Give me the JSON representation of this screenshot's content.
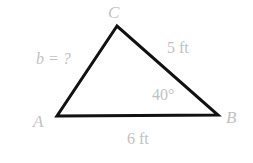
{
  "figure": {
    "type": "triangle-diagram",
    "background_color": "#ffffff",
    "stroke_color": "#111111",
    "label_color": "#c2c2c2",
    "width": 253,
    "height": 163
  },
  "vertices": {
    "A": {
      "label": "A",
      "x": 57,
      "y": 116
    },
    "B": {
      "label": "B",
      "x": 218,
      "y": 115
    },
    "C": {
      "label": "C",
      "x": 117,
      "y": 26
    }
  },
  "sides": {
    "a": {
      "label": "5 ft",
      "value": 5,
      "unit": "ft",
      "between": "C-B"
    },
    "b": {
      "label": "b = ?",
      "value": null,
      "unit": "ft",
      "between": "A-C"
    },
    "c": {
      "label": "6 ft",
      "value": 6,
      "unit": "ft",
      "between": "A-B"
    }
  },
  "angles": {
    "B": {
      "value": "40",
      "degree_symbol": "°",
      "label": "40°",
      "at_vertex": "B"
    }
  }
}
